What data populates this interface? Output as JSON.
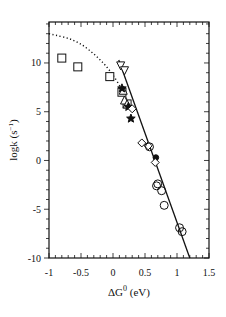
{
  "chart_data": {
    "type": "scatter",
    "title": "",
    "xlabel": "ΔG0 (eV)",
    "ylabel": "logk (s−1)",
    "xlim": [
      -1,
      1.5
    ],
    "ylim": [
      -10,
      14.2
    ],
    "xticks": [
      -1,
      -0.5,
      0,
      0.5,
      1,
      1.5
    ],
    "xtick_labels": [
      "-1",
      "-0.5",
      "0",
      "0.5",
      "1",
      "1.5"
    ],
    "yticks": [
      -10,
      -5,
      0,
      5,
      10
    ],
    "ytick_labels": [
      "-10",
      "-5",
      "0",
      "5",
      "10"
    ],
    "grid": false,
    "legend": null,
    "series": [
      {
        "name": "open squares",
        "marker": "square-open",
        "points": [
          [
            -0.8,
            10.5
          ],
          [
            -0.55,
            9.6
          ],
          [
            -0.05,
            8.6
          ],
          [
            0.14,
            7.0
          ],
          [
            0.22,
            5.8
          ]
        ]
      },
      {
        "name": "open down-triangles",
        "marker": "triangle-down-open",
        "points": [
          [
            0.12,
            9.7
          ],
          [
            0.18,
            9.2
          ]
        ]
      },
      {
        "name": "open up-triangles",
        "marker": "triangle-up-open",
        "points": [
          [
            0.16,
            7.2
          ],
          [
            0.18,
            6.2
          ],
          [
            0.22,
            5.8
          ]
        ]
      },
      {
        "name": "filled stars",
        "marker": "star-filled",
        "points": [
          [
            0.14,
            7.4
          ],
          [
            0.24,
            5.5
          ],
          [
            0.28,
            4.3
          ]
        ]
      },
      {
        "name": "open diamonds",
        "marker": "diamond-open",
        "points": [
          [
            0.3,
            5.3
          ],
          [
            0.45,
            1.8
          ],
          [
            0.55,
            1.5
          ]
        ]
      },
      {
        "name": "open circles",
        "marker": "circle-open",
        "points": [
          [
            0.57,
            1.4
          ],
          [
            0.68,
            -2.6
          ],
          [
            0.7,
            -2.4
          ],
          [
            0.76,
            -3.1
          ],
          [
            0.8,
            -4.6
          ],
          [
            1.04,
            -6.9
          ],
          [
            1.08,
            -7.3
          ]
        ]
      },
      {
        "name": "filled circle",
        "marker": "circle-filled",
        "points": [
          [
            0.67,
            0.3
          ]
        ]
      },
      {
        "name": "open diamond lower",
        "marker": "diamond-open",
        "points": [
          [
            0.66,
            -0.2
          ]
        ]
      }
    ],
    "lines": [
      {
        "name": "linear fit",
        "style": "solid",
        "points": [
          [
            0.09,
            10.3
          ],
          [
            1.2,
            -10.0
          ]
        ]
      },
      {
        "name": "Marcus parabola",
        "style": "dotted",
        "points": [
          [
            -1.0,
            13.0
          ],
          [
            -0.6,
            12.4
          ],
          [
            -0.3,
            11.0
          ],
          [
            -0.05,
            9.3
          ],
          [
            0.15,
            7.2
          ],
          [
            0.3,
            5.2
          ]
        ]
      }
    ]
  }
}
